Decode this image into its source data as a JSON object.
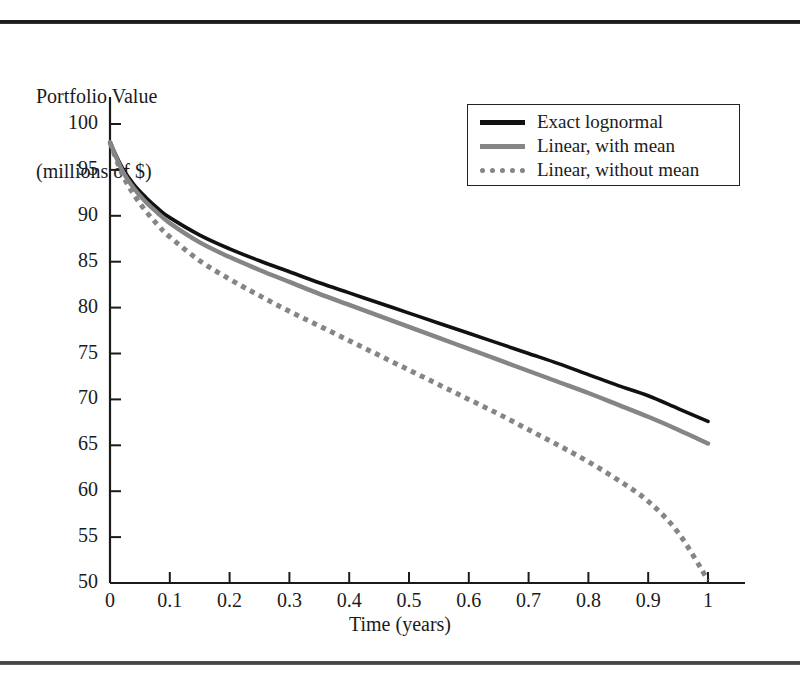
{
  "figure": {
    "ylabel_line1": "Portfolio Value",
    "ylabel_line2": "(millions of $)",
    "xlabel": "Time (years)",
    "rule_color": "#171717"
  },
  "legend": {
    "position": "top-right-inside",
    "entries": [
      {
        "label": "Exact lognormal",
        "style": "solid",
        "color": "#111111"
      },
      {
        "label": "Linear, with mean",
        "style": "solid",
        "color": "#858585"
      },
      {
        "label": "Linear, without mean",
        "style": "dotted",
        "color": "#858585"
      }
    ]
  },
  "chart_data": {
    "type": "line",
    "title": "",
    "subtitle": "",
    "xlabel": "Time (years)",
    "ylabel": "Portfolio Value (millions of $)",
    "xlim": [
      0,
      1
    ],
    "ylim": [
      50,
      100
    ],
    "xticks": [
      0,
      0.1,
      0.2,
      0.3,
      0.4,
      0.5,
      0.6,
      0.7,
      0.8,
      0.9,
      1
    ],
    "xticklabels": [
      "0",
      "0.1",
      "0.2",
      "0.3",
      "0.4",
      "0.5",
      "0.6",
      "0.7",
      "0.8",
      "0.9",
      "1"
    ],
    "yticks": [
      50,
      55,
      60,
      65,
      70,
      75,
      80,
      85,
      90,
      95,
      100
    ],
    "yticklabels": [
      "50",
      "55",
      "60",
      "65",
      "70",
      "75",
      "80",
      "85",
      "90",
      "95",
      "100"
    ],
    "grid": false,
    "legend_position": "upper right",
    "x": [
      0,
      0.02,
      0.04,
      0.06,
      0.08,
      0.1,
      0.15,
      0.2,
      0.25,
      0.3,
      0.35,
      0.4,
      0.45,
      0.5,
      0.55,
      0.6,
      0.65,
      0.7,
      0.75,
      0.8,
      0.85,
      0.9,
      0.95,
      1
    ],
    "series": [
      {
        "name": "Exact lognormal",
        "color": "#111111",
        "style": "solid",
        "values": [
          98.0,
          95.3,
          93.4,
          92.0,
          90.8,
          89.8,
          87.9,
          86.4,
          85.1,
          83.9,
          82.7,
          81.6,
          80.5,
          79.4,
          78.3,
          77.2,
          76.1,
          75.0,
          73.9,
          72.7,
          71.5,
          70.4,
          69.0,
          67.6
        ]
      },
      {
        "name": "Linear, with mean",
        "color": "#858585",
        "style": "solid",
        "values": [
          98.0,
          95.0,
          93.0,
          91.5,
          90.3,
          89.2,
          87.1,
          85.5,
          84.1,
          82.8,
          81.5,
          80.3,
          79.1,
          77.9,
          76.7,
          75.5,
          74.3,
          73.1,
          71.9,
          70.7,
          69.4,
          68.1,
          66.7,
          65.2
        ]
      },
      {
        "name": "Linear, without mean",
        "color": "#858585",
        "style": "dotted",
        "values": [
          98.0,
          94.6,
          92.3,
          90.5,
          89.0,
          87.7,
          85.1,
          83.1,
          81.3,
          79.6,
          78.0,
          76.4,
          74.8,
          73.2,
          71.6,
          70.0,
          68.4,
          66.7,
          65.0,
          63.2,
          61.2,
          58.9,
          55.5,
          50.3
        ]
      }
    ]
  },
  "plot_geometry": {
    "x0_px": 110,
    "x1_px": 708,
    "axis_right_px": 745,
    "y_top_px": 124,
    "y_bottom_px": 583,
    "axis_top_px": 97
  }
}
